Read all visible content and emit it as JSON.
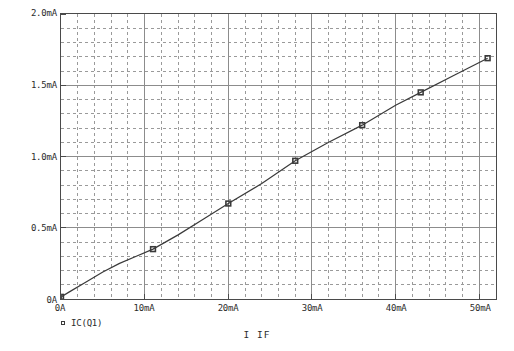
{
  "axes": {
    "x_title": "I  IF",
    "y_ticks": [
      "0A",
      "0.5mA",
      "1.0mA",
      "1.5mA",
      "2.0mA"
    ],
    "x_ticks": [
      "0A",
      "10mA",
      "20mA",
      "30mA",
      "40mA",
      "50mA"
    ]
  },
  "legend": {
    "series_label": "IC(Q1)",
    "marker": "square-marker"
  },
  "colors": {
    "trace": "#3a3a3a",
    "major_grid": "#8c8c8c",
    "minor_grid": "#9a9a9a",
    "frame": "#4a4a4a",
    "background": "#ffffff",
    "text": "#2b2b2b"
  },
  "chart_data": {
    "type": "line",
    "title": "",
    "subtitle": "",
    "xlabel": "I  IF",
    "ylabel": "",
    "xunit": "mA",
    "yunit": "mA",
    "xlim": [
      0,
      52
    ],
    "ylim": [
      0,
      2.0
    ],
    "x_major_ticks": [
      0,
      10,
      20,
      30,
      40,
      50
    ],
    "y_major_ticks": [
      0,
      0.5,
      1.0,
      1.5,
      2.0
    ],
    "x_minor_step": 2,
    "y_minor_step": 0.1,
    "grid": true,
    "grid_major_style": "solid",
    "grid_minor_style": "dashed",
    "legend_position": "below-left",
    "series": [
      {
        "name": "IC(Q1)",
        "marker": "square",
        "x": [
          0,
          1,
          3,
          5,
          7,
          9,
          11,
          14,
          17,
          20,
          24,
          28,
          32,
          36,
          40,
          43,
          47,
          51
        ],
        "y": [
          0.015,
          0.05,
          0.12,
          0.19,
          0.25,
          0.3,
          0.35,
          0.45,
          0.56,
          0.67,
          0.81,
          0.97,
          1.1,
          1.22,
          1.36,
          1.45,
          1.57,
          1.69
        ],
        "marker_points": [
          {
            "x": 0,
            "y": 0.015
          },
          {
            "x": 11,
            "y": 0.35
          },
          {
            "x": 20,
            "y": 0.67
          },
          {
            "x": 28,
            "y": 0.97
          },
          {
            "x": 36,
            "y": 1.22
          },
          {
            "x": 43,
            "y": 1.45
          },
          {
            "x": 51,
            "y": 1.69
          }
        ]
      }
    ]
  }
}
